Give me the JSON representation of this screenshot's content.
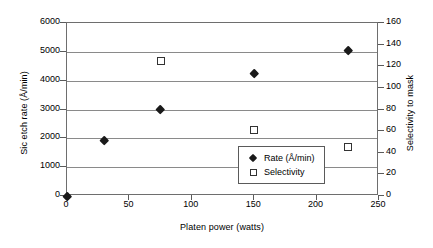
{
  "chart_data": {
    "type": "scatter",
    "title": "",
    "xlabel": "Platen power (watts)",
    "ylabel": "Sic etch rate (Å/min)",
    "ylabel_right": "Selectivity to mask",
    "xlim": [
      0,
      250
    ],
    "ylim": [
      0,
      6000
    ],
    "ylim_right": [
      0,
      160
    ],
    "xticks": [
      "0",
      "50",
      "100",
      "150",
      "200",
      "250"
    ],
    "xtick_values": [
      0,
      50,
      100,
      150,
      200,
      250
    ],
    "yticks": [
      "0",
      "1000",
      "2000",
      "3000",
      "4000",
      "5000",
      "6000"
    ],
    "ytick_values": [
      0,
      1000,
      2000,
      3000,
      4000,
      5000,
      6000
    ],
    "yticks_right": [
      "0",
      "20",
      "40",
      "60",
      "80",
      "100",
      "120",
      "140",
      "160"
    ],
    "ytick_values_right": [
      0,
      20,
      40,
      60,
      80,
      100,
      120,
      140,
      160
    ],
    "grid": true,
    "grid_axis": "y",
    "legend_position": "lower-right-inside",
    "series": [
      {
        "name": "Rate (Å/min)",
        "marker": "filled-diamond",
        "axis": "left",
        "color": "#1a1a1a",
        "points": [
          {
            "x": 0,
            "y": 0
          },
          {
            "x": 30,
            "y": 1950
          },
          {
            "x": 75,
            "y": 3000
          },
          {
            "x": 150,
            "y": 4270
          },
          {
            "x": 225,
            "y": 5070
          }
        ]
      },
      {
        "name": "Selectivity",
        "marker": "open-square",
        "axis": "right",
        "color": "#333333",
        "points": [
          {
            "x": 75,
            "y": 125
          },
          {
            "x": 150,
            "y": 61
          },
          {
            "x": 225,
            "y": 45
          }
        ]
      }
    ]
  },
  "legend": {
    "items": [
      {
        "label": "Rate (Å/min)",
        "marker": "filled-diamond"
      },
      {
        "label": "Selectivity",
        "marker": "open-square"
      }
    ]
  }
}
